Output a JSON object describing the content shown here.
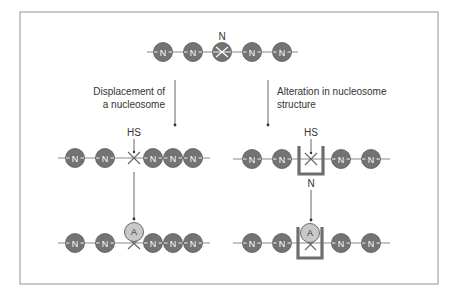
{
  "colors": {
    "nucleosome_fill": "#737373",
    "activator_fill": "#c8c8c8",
    "frame_stroke": "#b8b8b8",
    "box_stroke": "#6e6e6e"
  },
  "top": {
    "label_above_center": "N",
    "nodes": [
      {
        "cx": 163,
        "label": "N"
      },
      {
        "cx": 193,
        "label": "N"
      },
      {
        "cx": 222,
        "label": "",
        "crossed": true
      },
      {
        "cx": 252,
        "label": "N"
      },
      {
        "cx": 282,
        "label": "N"
      }
    ]
  },
  "left_branch": {
    "caption_line1": "Displacement of",
    "caption_line2": "a nucleosome",
    "hs_label": "HS",
    "row2_nodes": [
      {
        "cx": 75,
        "label": "N"
      },
      {
        "cx": 105,
        "label": "N"
      },
      {
        "cx": 153,
        "label": "N"
      },
      {
        "cx": 173,
        "label": "N"
      },
      {
        "cx": 193,
        "label": "N"
      }
    ],
    "row3_nodes": [
      {
        "cx": 75,
        "label": "N"
      },
      {
        "cx": 105,
        "label": "N"
      },
      {
        "cx": 153,
        "label": "N"
      },
      {
        "cx": 173,
        "label": "N"
      },
      {
        "cx": 193,
        "label": "N"
      }
    ],
    "activator_label": "A"
  },
  "right_branch": {
    "caption_line1": "Alteration in nucleosome",
    "caption_line2": "structure",
    "hs_label": "HS",
    "box_label": "N",
    "row2_nodes": [
      {
        "cx": 252,
        "label": "N"
      },
      {
        "cx": 282,
        "label": "N"
      },
      {
        "cx": 341,
        "label": "N"
      },
      {
        "cx": 371,
        "label": "N"
      }
    ],
    "row3_nodes": [
      {
        "cx": 252,
        "label": "N"
      },
      {
        "cx": 282,
        "label": "N"
      },
      {
        "cx": 341,
        "label": "N"
      },
      {
        "cx": 371,
        "label": "N"
      }
    ],
    "activator_label": "A"
  }
}
